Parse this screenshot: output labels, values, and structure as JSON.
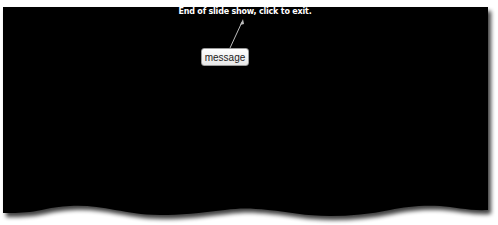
{
  "slideshow": {
    "end_message": "End of slide show, click to exit.",
    "background_color": "#000000",
    "text_color": "#ffffff"
  },
  "annotation": {
    "callout_label": "message",
    "callout_border_color": "#9a9a9a"
  }
}
